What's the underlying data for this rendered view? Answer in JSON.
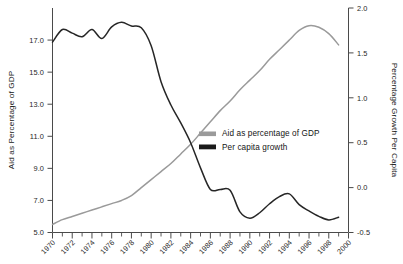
{
  "chart_data": {
    "type": "line",
    "title": "",
    "xlabel": "",
    "ylabel": "Aid as Percentage of GDP",
    "y2label": "Percentage Growth Per Capita",
    "grid": false,
    "legend_position": "center-right",
    "xlim": [
      1970,
      2000
    ],
    "ylim": [
      5.0,
      19.0
    ],
    "y2lim": [
      -0.5,
      2.0
    ],
    "x_tick_labels": [
      "1970",
      "1972",
      "1974",
      "1976",
      "1978",
      "1980",
      "1982",
      "1984",
      "1986",
      "1988",
      "1990",
      "1992",
      "1994",
      "1996",
      "1998",
      "2000"
    ],
    "x_ticks_minor_every": 1,
    "y_tick_labels": [
      "5.0",
      "7.0",
      "9.0",
      "11.0",
      "13.0",
      "15.0",
      "17.0"
    ],
    "y_ticks": [
      5.0,
      7.0,
      9.0,
      11.0,
      13.0,
      15.0,
      17.0
    ],
    "y2_tick_labels": [
      "-0.5",
      "0.0",
      "0.5",
      "1.0",
      "1.5",
      "2.0"
    ],
    "y2_ticks": [
      -0.5,
      0.0,
      0.5,
      1.0,
      1.5,
      2.0
    ],
    "x": [
      1970,
      1971,
      1972,
      1973,
      1974,
      1975,
      1976,
      1977,
      1978,
      1979,
      1980,
      1981,
      1982,
      1983,
      1984,
      1985,
      1986,
      1987,
      1988,
      1989,
      1990,
      1991,
      1992,
      1993,
      1994,
      1995,
      1996,
      1997,
      1998,
      1999
    ],
    "series": [
      {
        "name": "Aid as percentage of GDP",
        "axis": "left",
        "color": "#9a9a9a",
        "units": "percent of GDP",
        "values": [
          5.5,
          5.8,
          6.0,
          6.2,
          6.4,
          6.6,
          6.8,
          7.0,
          7.3,
          7.8,
          8.3,
          8.8,
          9.3,
          9.9,
          10.5,
          11.2,
          11.9,
          12.6,
          13.2,
          13.9,
          14.5,
          15.1,
          15.8,
          16.4,
          17.0,
          17.6,
          17.9,
          17.8,
          17.4,
          16.7
        ]
      },
      {
        "name": "Per capita growth",
        "axis": "right",
        "color": "#1a1a1a",
        "units": "percentage growth per capita",
        "values": [
          1.62,
          1.76,
          1.72,
          1.68,
          1.76,
          1.66,
          1.79,
          1.84,
          1.8,
          1.78,
          1.58,
          1.18,
          0.92,
          0.72,
          0.5,
          0.22,
          -0.02,
          -0.02,
          -0.03,
          -0.27,
          -0.34,
          -0.28,
          -0.18,
          -0.1,
          -0.07,
          -0.19,
          -0.26,
          -0.32,
          -0.36,
          -0.33
        ]
      }
    ],
    "legend_entries": [
      {
        "label": "Aid as percentage of GDP",
        "color": "#9a9a9a"
      },
      {
        "label": "Per capita growth",
        "color": "#1a1a1a"
      }
    ]
  }
}
